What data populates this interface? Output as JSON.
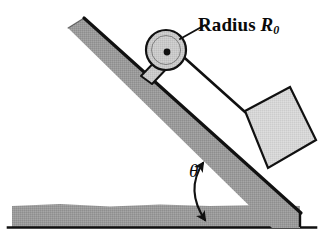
{
  "figure": {
    "name": "inclined-plane-pulley-block-diagram",
    "background_color": "#ffffff",
    "outline_color": "#111111",
    "labels": {
      "radius_text": "Radius",
      "radius_symbol": "R",
      "radius_subscript": "0",
      "angle_symbol": "θ"
    },
    "colors": {
      "incline_fill": "#9a9a9a",
      "ground_fill": "#9a9a9a",
      "block_fill": "#d6d6d6",
      "pulley_fill": "#c9c9c9",
      "bracket_fill": "#bdbdbd",
      "line": "#111111",
      "cord": "#111111"
    },
    "parts": {
      "incline": "inclined-ramp",
      "ground": "ground-surface",
      "pulley": "pulley-wheel",
      "pulley_axle": "pulley-axle",
      "pulley_bracket": "pulley-mount-bracket",
      "block": "block-on-incline",
      "cord": "cord-from-pulley-to-block",
      "angle_arc": "incline-angle-arc",
      "leader": "radius-leader-line"
    }
  }
}
